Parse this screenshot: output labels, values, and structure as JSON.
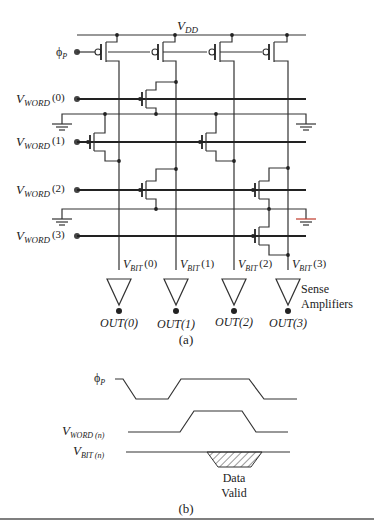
{
  "figure_a": {
    "caption": "(a)",
    "supply_label_main": "V",
    "supply_label_sub": "DD",
    "precharge_label_main": "ϕ",
    "precharge_label_sub": "P",
    "word_lines": [
      {
        "main": "V",
        "sub": "WORD",
        "index": "(0)"
      },
      {
        "main": "V",
        "sub": "WORD",
        "index": "(1)"
      },
      {
        "main": "V",
        "sub": "WORD",
        "index": "(2)"
      },
      {
        "main": "V",
        "sub": "WORD",
        "index": "(3)"
      }
    ],
    "bit_lines": [
      {
        "main": "V",
        "sub": "BIT",
        "index": "(0)"
      },
      {
        "main": "V",
        "sub": "BIT",
        "index": "(1)"
      },
      {
        "main": "V",
        "sub": "BIT",
        "index": "(2)"
      },
      {
        "main": "V",
        "sub": "BIT",
        "index": "(3)"
      }
    ],
    "outputs": [
      "OUT(0)",
      "OUT(1)",
      "OUT(2)",
      "OUT(3)"
    ],
    "amplifier_label_line1": "Sense",
    "amplifier_label_line2": "Amplifiers"
  },
  "figure_b": {
    "caption": "(b)",
    "signals": [
      {
        "main": "ϕ",
        "sub": "P"
      },
      {
        "main": "V",
        "sub": "WORD (n)"
      },
      {
        "main": "V",
        "sub": "BIT (n)"
      }
    ],
    "annotation_line1": "Data",
    "annotation_line2": "Valid"
  }
}
